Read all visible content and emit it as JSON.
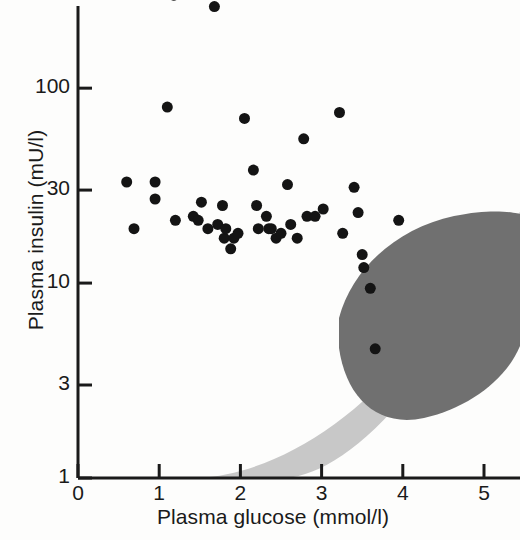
{
  "chart_data": {
    "type": "scatter",
    "title": "",
    "xlabel": "Plasma glucose (mmol/l)",
    "ylabel": "Plasma insulin (mU/l)",
    "xlim": [
      0,
      5.45
    ],
    "ylim": [
      1,
      400
    ],
    "yscale": "log",
    "xscale": "linear",
    "grid": false,
    "legend": null,
    "xticks": [
      "0",
      "1",
      "2",
      "3",
      "4",
      "5"
    ],
    "xtick_values": [
      0,
      1,
      2,
      3,
      4,
      5
    ],
    "yticks": [
      "1",
      "3",
      "10",
      "30",
      "100",
      "300"
    ],
    "ytick_values": [
      1,
      3,
      10,
      30,
      100,
      300
    ],
    "marker": {
      "shape": "circle",
      "color": "#141414",
      "size": 11
    },
    "points": [
      {
        "x": 1.18,
        "y": 300
      },
      {
        "x": 1.68,
        "y": 262
      },
      {
        "x": 0.6,
        "y": 33
      },
      {
        "x": 0.69,
        "y": 19
      },
      {
        "x": 0.95,
        "y": 33
      },
      {
        "x": 1.1,
        "y": 80
      },
      {
        "x": 0.95,
        "y": 27
      },
      {
        "x": 1.2,
        "y": 21
      },
      {
        "x": 1.42,
        "y": 22
      },
      {
        "x": 1.48,
        "y": 21
      },
      {
        "x": 1.52,
        "y": 26
      },
      {
        "x": 1.6,
        "y": 19
      },
      {
        "x": 1.72,
        "y": 20
      },
      {
        "x": 1.78,
        "y": 25
      },
      {
        "x": 1.8,
        "y": 17
      },
      {
        "x": 1.82,
        "y": 19
      },
      {
        "x": 1.88,
        "y": 15
      },
      {
        "x": 1.92,
        "y": 17
      },
      {
        "x": 1.97,
        "y": 18
      },
      {
        "x": 2.05,
        "y": 70
      },
      {
        "x": 2.16,
        "y": 38
      },
      {
        "x": 2.2,
        "y": 25
      },
      {
        "x": 2.22,
        "y": 19
      },
      {
        "x": 2.32,
        "y": 22
      },
      {
        "x": 2.35,
        "y": 19
      },
      {
        "x": 2.38,
        "y": 19
      },
      {
        "x": 2.44,
        "y": 17
      },
      {
        "x": 2.5,
        "y": 18
      },
      {
        "x": 2.58,
        "y": 32
      },
      {
        "x": 2.62,
        "y": 20
      },
      {
        "x": 2.7,
        "y": 17
      },
      {
        "x": 2.78,
        "y": 55
      },
      {
        "x": 2.82,
        "y": 22
      },
      {
        "x": 2.92,
        "y": 22
      },
      {
        "x": 3.02,
        "y": 24
      },
      {
        "x": 3.22,
        "y": 75
      },
      {
        "x": 3.26,
        "y": 18
      },
      {
        "x": 3.4,
        "y": 31
      },
      {
        "x": 3.45,
        "y": 23
      },
      {
        "x": 3.5,
        "y": 14
      },
      {
        "x": 3.52,
        "y": 12
      },
      {
        "x": 3.6,
        "y": 9.4
      },
      {
        "x": 3.66,
        "y": 4.6
      },
      {
        "x": 3.95,
        "y": 21
      }
    ],
    "regions": [
      {
        "name": "normal-range-band",
        "color": "#c8c8c8",
        "description": "light grey curved reference band sweeping from lower-left to upper-right"
      },
      {
        "name": "hyperinsulinaemia-zone",
        "color": "#707070",
        "description": "dark grey lens-shaped ellipse centred near glucose 4.2, insulin 11"
      }
    ]
  },
  "axes": {
    "x": {
      "label": "Plasma glucose (mmol/l)",
      "ticks": [
        {
          "label": "0",
          "value": 0
        },
        {
          "label": "1",
          "value": 1
        },
        {
          "label": "2",
          "value": 2
        },
        {
          "label": "3",
          "value": 3
        },
        {
          "label": "4",
          "value": 4
        },
        {
          "label": "5",
          "value": 5
        }
      ]
    },
    "y": {
      "label": "Plasma insulin (mU/l)",
      "ticks": [
        {
          "label": "300",
          "value": 300
        },
        {
          "label": "100",
          "value": 100
        },
        {
          "label": "30",
          "value": 30
        },
        {
          "label": "10",
          "value": 10
        },
        {
          "label": "3",
          "value": 3
        },
        {
          "label": "1",
          "value": 1
        }
      ]
    }
  },
  "colors": {
    "axis": "#1a1a1a",
    "marker": "#141414",
    "dark_region": "#707070",
    "light_region": "#c8c8c8",
    "background": "#fdfdfc"
  }
}
